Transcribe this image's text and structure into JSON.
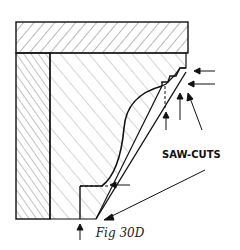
{
  "figure": {
    "caption": "Fig 30D",
    "callout_label": "SAW-CUTS",
    "colors": {
      "ink": "#111111",
      "background": "#ffffff"
    }
  }
}
